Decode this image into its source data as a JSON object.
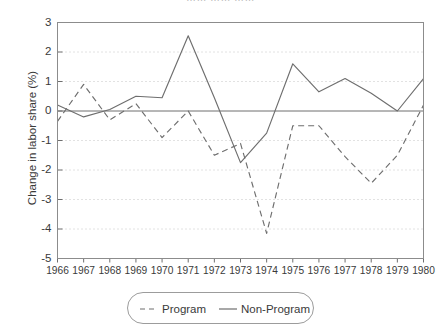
{
  "figure": {
    "cropped_title": "……  ……   ……",
    "ylabel": "Change in labor share (%)"
  },
  "legend": {
    "box_name": "legend",
    "entries": [
      {
        "label": "Program",
        "style": "dashed",
        "color": "#6e6e6e"
      },
      {
        "label": "Non-Program",
        "style": "solid",
        "color": "#6e6e6e"
      }
    ]
  },
  "chart_data": {
    "type": "line",
    "title": "",
    "xlabel": "",
    "ylabel": "Change in labor share (%)",
    "x": [
      1966,
      1967,
      1968,
      1969,
      1970,
      1971,
      1972,
      1973,
      1974,
      1975,
      1976,
      1977,
      1978,
      1979,
      1980
    ],
    "xtick_labels": [
      "1966",
      "1967",
      "1968",
      "1969",
      "1970",
      "1971",
      "1972",
      "1973",
      "1974",
      "1975",
      "1976",
      "1977",
      "1978",
      "1979",
      "1980"
    ],
    "ytick_labels": [
      "3",
      "2",
      "1",
      "0",
      "-1",
      "-2",
      "-3",
      "-4",
      "-5"
    ],
    "yticks": [
      3,
      2,
      1,
      0,
      -1,
      -2,
      -3,
      -4,
      -5
    ],
    "xlim": [
      1966,
      1980
    ],
    "ylim": [
      -5,
      3
    ],
    "grid": "horizontal-dotted",
    "zero_line": true,
    "legend_position": "below-center",
    "series": [
      {
        "name": "Program",
        "style": "dashed",
        "color": "#6e6e6e",
        "values": [
          -0.35,
          0.9,
          -0.3,
          0.25,
          -0.9,
          0.0,
          -1.5,
          -1.1,
          -4.15,
          -0.5,
          -0.5,
          -1.55,
          -2.45,
          -1.5,
          0.2
        ]
      },
      {
        "name": "Non-Program",
        "style": "solid",
        "color": "#6e6e6e",
        "values": [
          0.2,
          -0.2,
          0.05,
          0.5,
          0.45,
          2.55,
          0.45,
          -1.75,
          -0.75,
          1.6,
          0.65,
          1.1,
          0.6,
          0.0,
          1.1
        ]
      }
    ]
  }
}
